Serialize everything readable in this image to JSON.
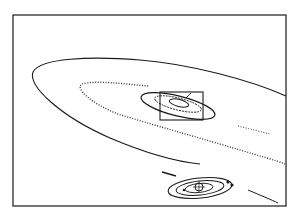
{
  "diagram": {
    "type": "line-illustration",
    "text_labels": [],
    "colors": {
      "background": "#ffffff",
      "ink": "#1a1a1a",
      "speckle": "#3a3a3a"
    },
    "frame": {
      "x": 13,
      "y": 15,
      "width": 273,
      "height": 191
    },
    "elements": [
      {
        "name": "outer-orbit-ellipse",
        "kind": "solid-curve"
      },
      {
        "name": "dotted-particle-band",
        "kind": "dotted-curve"
      },
      {
        "name": "central-disk-ellipse",
        "kind": "solid-ellipse"
      },
      {
        "name": "zoom-inset-box",
        "kind": "rectangle",
        "x": 160,
        "y": 92,
        "width": 43,
        "height": 28
      },
      {
        "name": "planetary-system",
        "kind": "concentric-orbits"
      }
    ]
  }
}
